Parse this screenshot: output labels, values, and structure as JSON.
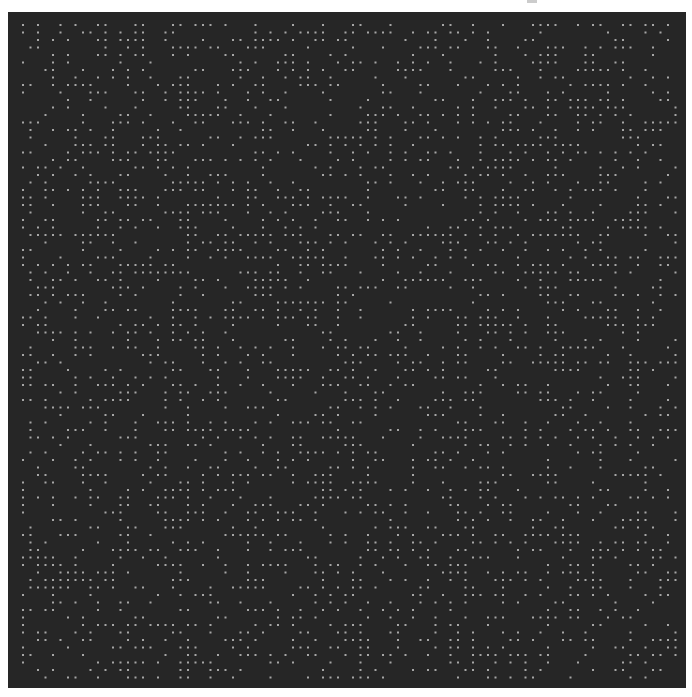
{
  "image": {
    "width": 692,
    "height": 697,
    "page_background": "#ffffff"
  },
  "dot_field": {
    "x": 8,
    "y": 12,
    "width": 678,
    "height": 676,
    "background": "#262626",
    "dot_color": "#a6a6a6",
    "dot_size": 2,
    "first_dot_x": 23,
    "first_dot_y": 25,
    "spacing": 7.5,
    "columns": 88,
    "rows": 88,
    "density": 0.36,
    "seed": 12345
  }
}
